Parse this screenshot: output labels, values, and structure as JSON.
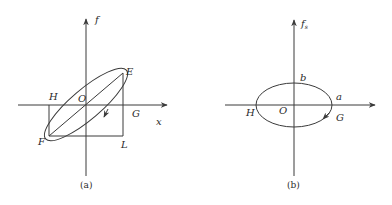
{
  "panel_a": {
    "caption": "(a)",
    "y_axis_label": "f",
    "x_axis_label": "x",
    "points": {
      "E": "E",
      "F": "F",
      "H": "H",
      "O": "O",
      "G": "G",
      "L": "L"
    },
    "description": "Tilted hysteresis ellipse through E and F with diagonal line EF through origin O; rectangle H-E-L-F bounding the loop; direction arrow on lower branch"
  },
  "panel_b": {
    "caption": "(b)",
    "y_axis_label": "f",
    "y_axis_subscript": "s",
    "points": {
      "b": "b",
      "a": "a",
      "H": "H",
      "O": "O",
      "G": "G"
    },
    "description": "Axis-aligned ellipse centered at origin O with semi-axes a (horizontal) and b (vertical); direction arrow on lower-right branch"
  },
  "colors": {
    "line": "#3a3a3a",
    "text": "#2a2a2a",
    "background": "#ffffff"
  }
}
